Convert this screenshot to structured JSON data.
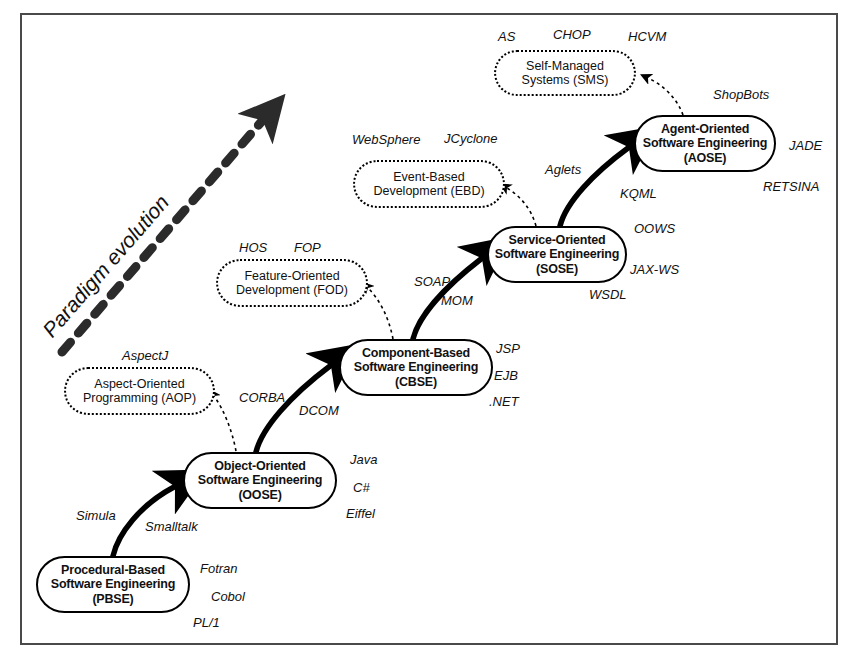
{
  "diagram": {
    "frame_border_color": "#4a4a4a",
    "paradigm_arrow_label": "Paradigm evolution",
    "paradigms": [
      {
        "id": "pbse",
        "line1": "Procedural-Based",
        "line2": "Software Engineering",
        "line3": "(PBSE)",
        "style": "solid"
      },
      {
        "id": "oose",
        "line1": "Object-Oriented",
        "line2": "Software Engineering",
        "line3": "(OOSE)",
        "style": "solid"
      },
      {
        "id": "cbse",
        "line1": "Component-Based",
        "line2": "Software Engineering",
        "line3": "(CBSE)",
        "style": "solid"
      },
      {
        "id": "sose",
        "line1": "Service-Oriented",
        "line2": "Software Engineering",
        "line3": "(SOSE)",
        "style": "solid"
      },
      {
        "id": "aose",
        "line1": "Agent-Oriented",
        "line2": "Software Engineering",
        "line3": "(AOSE)",
        "style": "solid"
      }
    ],
    "approaches": [
      {
        "id": "aop",
        "line1": "Aspect-Oriented",
        "line2": "Programming (AOP)",
        "style": "dashed"
      },
      {
        "id": "fod",
        "line1": "Feature-Oriented",
        "line2": "Development (FOD)",
        "style": "dashed"
      },
      {
        "id": "ebd",
        "line1": "Event-Based",
        "line2": "Development (EBD)",
        "style": "dashed"
      },
      {
        "id": "sms",
        "line1": "Self-Managed",
        "line2": "Systems (SMS)",
        "style": "dashed"
      }
    ],
    "technologies": {
      "pbse": [
        "Fotran",
        "Cobol",
        "PL/1"
      ],
      "oose": [
        "Java",
        "C#",
        "Eiffel"
      ],
      "cbse": [
        "JSP",
        "EJB",
        ".NET"
      ],
      "sose": [
        "OOWS",
        "JAX-WS",
        "WSDL"
      ],
      "aose": [
        "ShopBots",
        "JADE",
        "RETSINA"
      ],
      "aop": [
        "AspectJ"
      ],
      "fod": [
        "HOS",
        "FOP"
      ],
      "ebd": [
        "WebSphere",
        "JCyclone"
      ],
      "sms": [
        "AS",
        "CHOP",
        "HCVM"
      ]
    },
    "transitions": [
      {
        "from": "pbse",
        "to": "oose",
        "labels": [
          "Simula",
          "Smalltalk"
        ]
      },
      {
        "from": "oose",
        "to": "cbse",
        "labels": [
          "CORBA",
          "DCOM"
        ]
      },
      {
        "from": "cbse",
        "to": "sose",
        "labels": [
          "SOAP",
          "MOM"
        ]
      },
      {
        "from": "sose",
        "to": "aose",
        "labels": [
          "Aglets",
          "KQML"
        ]
      }
    ]
  }
}
